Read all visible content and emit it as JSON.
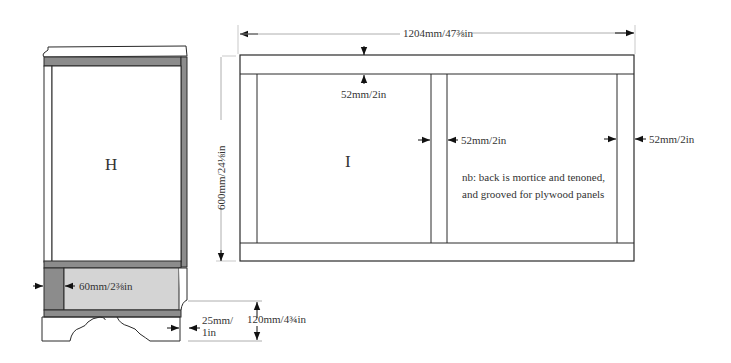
{
  "colors": {
    "line": "#2a2a2a",
    "dim_line": "#9a9a9a",
    "dark_grey": "#8c8c8c",
    "light_grey": "#d4d4d4",
    "white": "#ffffff"
  },
  "side_view": {
    "panel_label": "H",
    "rail_dimension": "60mm/2⅜in",
    "plinth_dimension_line1": "25mm/",
    "plinth_dimension_line2": "1in",
    "plinth_height": "120mm/4¾in"
  },
  "back_view": {
    "panel_label": "I",
    "overall_width": "1204mm/47⅜in",
    "overall_height": "600mm/24⅛in",
    "top_rail": "52mm/2in",
    "centre_stile": "52mm/2in",
    "end_stile": "52mm/2in",
    "note_line1": "nb: back is mortice and tenoned,",
    "note_line2": "and grooved for plywood panels"
  }
}
